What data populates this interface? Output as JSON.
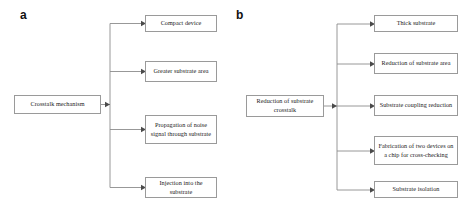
{
  "figure": {
    "type": "flowchart",
    "panels": [
      {
        "id": "a",
        "label": "a",
        "root": {
          "label": "Crosstalk mechanism"
        },
        "children": [
          {
            "label": "Compact device"
          },
          {
            "label": "Greater substrate area"
          },
          {
            "label": "Propagation of noise signal through substrate"
          },
          {
            "label": "Injection into the substrate"
          }
        ]
      },
      {
        "id": "b",
        "label": "b",
        "root": {
          "label": "Reduction of substrate crosstalk"
        },
        "children": [
          {
            "label": "Thick substrate"
          },
          {
            "label": "Reduction of substrate area"
          },
          {
            "label": "Substrate coupling reduction"
          },
          {
            "label": "Fabrication of two devices on a chip for cross-checking"
          },
          {
            "label": "Substrate isolation"
          }
        ]
      }
    ],
    "colors": {
      "background": "#ffffff",
      "box_border": "#9a9a9a",
      "box_fill": "#ffffff",
      "connector": "#8c8c8c",
      "arrowhead": "#4a4a4a",
      "text": "#1a1a1a",
      "panel_label": "#111111"
    }
  }
}
